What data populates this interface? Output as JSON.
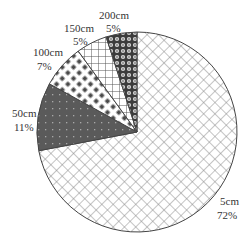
{
  "chart_data": {
    "type": "pie",
    "title": "",
    "start_angle_deg": -90,
    "direction": "clockwise",
    "center": [
      137,
      132
    ],
    "radius": 100,
    "legend": "none (direct labels)",
    "slices": [
      {
        "label": "5cm",
        "value": 72,
        "display": "72%",
        "pattern": "diagonal-crosshatch-light",
        "color": "#ffffff",
        "ink": "#8a8a8a",
        "label_pos": [
          228,
          206
        ]
      },
      {
        "label": "50cm",
        "value": 11,
        "display": "11%",
        "pattern": "dark-dotted",
        "color": "#5a5a5a",
        "ink": "#9a9a9a",
        "label_pos": [
          22,
          117
        ]
      },
      {
        "label": "100cm",
        "value": 7,
        "display": "7%",
        "pattern": "diamond-dots",
        "color": "#ffffff",
        "ink": "#4a4a4a",
        "label_pos": [
          46,
          55
        ]
      },
      {
        "label": "150cm",
        "value": 5,
        "display": "5%",
        "pattern": "square-grid",
        "color": "#ffffff",
        "ink": "#555555",
        "label_pos": [
          82,
          37
        ]
      },
      {
        "label": "200cm",
        "value": 5,
        "display": "5%",
        "pattern": "circles-dark",
        "color": "#bdbdbd",
        "ink": "#3a3a3a",
        "label_pos": [
          119,
          18
        ]
      }
    ]
  },
  "labels": {
    "s0_name": "5cm",
    "s0_pct": "72%",
    "s1_name": "50cm",
    "s1_pct": "11%",
    "s2_name": "100cm",
    "s2_pct": "7%",
    "s3_name": "150cm",
    "s3_pct": "5%",
    "s4_name": "200cm",
    "s4_pct": "5%"
  }
}
